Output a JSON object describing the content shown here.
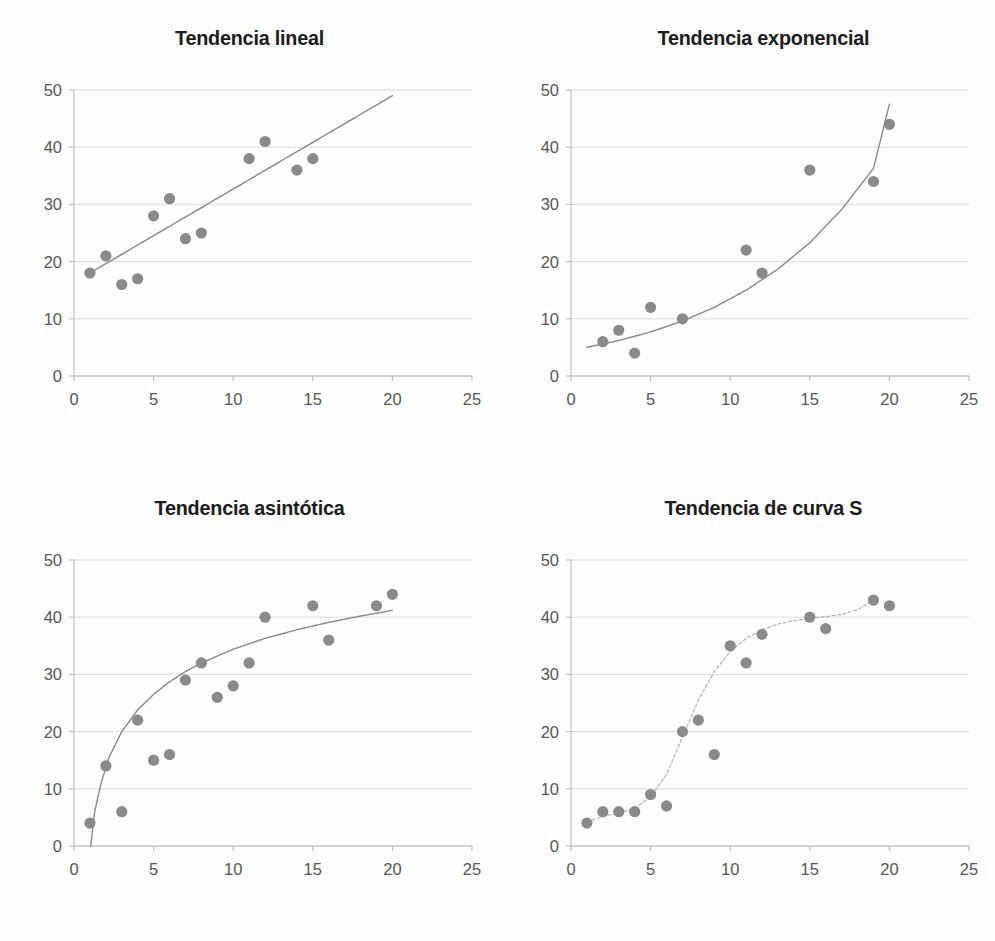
{
  "figure": {
    "background": "#fdfdfd",
    "dot_color": "#8a8a8a",
    "line_color": "#7d7d7d",
    "grid_color": "#d6d6de",
    "axis_color": "#b9b9c2",
    "tick_text_color": "#575757",
    "title_color": "#1b1b1b"
  },
  "panels": [
    {
      "id": "lineal",
      "title": "Tendencia lineal",
      "chart_data": {
        "type": "scatter",
        "title": "Tendencia lineal",
        "xlabel": "",
        "ylabel": "",
        "xlim": [
          0,
          25
        ],
        "ylim": [
          0,
          50
        ],
        "xticks": [
          "0",
          "5",
          "10",
          "15",
          "20",
          "25"
        ],
        "yticks": [
          "0",
          "10",
          "20",
          "30",
          "40",
          "50"
        ],
        "grid": true,
        "legend": "none",
        "points": [
          {
            "x": 1,
            "y": 18
          },
          {
            "x": 2,
            "y": 21
          },
          {
            "x": 3,
            "y": 16
          },
          {
            "x": 4,
            "y": 17
          },
          {
            "x": 5,
            "y": 28
          },
          {
            "x": 6,
            "y": 31
          },
          {
            "x": 7,
            "y": 24
          },
          {
            "x": 8,
            "y": 25
          },
          {
            "x": 11,
            "y": 38
          },
          {
            "x": 12,
            "y": 41
          },
          {
            "x": 14,
            "y": 36
          },
          {
            "x": 15,
            "y": 38
          }
        ],
        "trend": {
          "kind": "linear",
          "annotation": "recta de regresion",
          "points": [
            {
              "x": 1,
              "y": 18.0
            },
            {
              "x": 20,
              "y": 49.0
            }
          ]
        }
      }
    },
    {
      "id": "exponencial",
      "title": "Tendencia exponencial",
      "chart_data": {
        "type": "scatter",
        "title": "Tendencia exponencial",
        "xlabel": "",
        "ylabel": "",
        "xlim": [
          0,
          25
        ],
        "ylim": [
          0,
          50
        ],
        "xticks": [
          "0",
          "5",
          "10",
          "15",
          "20",
          "25"
        ],
        "yticks": [
          "0",
          "10",
          "20",
          "30",
          "40",
          "50"
        ],
        "grid": true,
        "legend": "none",
        "points": [
          {
            "x": 2,
            "y": 6
          },
          {
            "x": 3,
            "y": 8
          },
          {
            "x": 4,
            "y": 4
          },
          {
            "x": 5,
            "y": 12
          },
          {
            "x": 7,
            "y": 10
          },
          {
            "x": 11,
            "y": 22
          },
          {
            "x": 12,
            "y": 18
          },
          {
            "x": 15,
            "y": 36
          },
          {
            "x": 19,
            "y": 34
          },
          {
            "x": 20,
            "y": 44
          }
        ],
        "trend": {
          "kind": "exponential",
          "annotation": "curva exponencial",
          "points": [
            {
              "x": 1,
              "y": 5.0
            },
            {
              "x": 3,
              "y": 6.2
            },
            {
              "x": 5,
              "y": 7.7
            },
            {
              "x": 7,
              "y": 9.6
            },
            {
              "x": 9,
              "y": 12.0
            },
            {
              "x": 11,
              "y": 15.0
            },
            {
              "x": 13,
              "y": 18.7
            },
            {
              "x": 15,
              "y": 23.3
            },
            {
              "x": 17,
              "y": 29.1
            },
            {
              "x": 19,
              "y": 36.3
            },
            {
              "x": 20,
              "y": 47.5
            }
          ]
        }
      }
    },
    {
      "id": "asintotica",
      "title": "Tendencia asintótica",
      "chart_data": {
        "type": "scatter",
        "title": "Tendencia asintótica",
        "xlabel": "",
        "ylabel": "",
        "xlim": [
          0,
          25
        ],
        "ylim": [
          0,
          50
        ],
        "xticks": [
          "0",
          "5",
          "10",
          "15",
          "20",
          "25"
        ],
        "yticks": [
          "0",
          "10",
          "20",
          "30",
          "40",
          "50"
        ],
        "grid": true,
        "legend": "none",
        "points": [
          {
            "x": 1,
            "y": 4
          },
          {
            "x": 2,
            "y": 14
          },
          {
            "x": 3,
            "y": 6
          },
          {
            "x": 4,
            "y": 22
          },
          {
            "x": 5,
            "y": 15
          },
          {
            "x": 6,
            "y": 16
          },
          {
            "x": 7,
            "y": 29
          },
          {
            "x": 8,
            "y": 32
          },
          {
            "x": 9,
            "y": 26
          },
          {
            "x": 10,
            "y": 28
          },
          {
            "x": 11,
            "y": 32
          },
          {
            "x": 12,
            "y": 40
          },
          {
            "x": 15,
            "y": 42
          },
          {
            "x": 16,
            "y": 36
          },
          {
            "x": 19,
            "y": 42
          },
          {
            "x": 20,
            "y": 44
          }
        ],
        "trend": {
          "kind": "asymptotic",
          "annotation": "curva asintotica",
          "points": [
            {
              "x": 1.05,
              "y": 0.0
            },
            {
              "x": 1.3,
              "y": 6.0
            },
            {
              "x": 1.7,
              "y": 11.0
            },
            {
              "x": 2.2,
              "y": 15.5
            },
            {
              "x": 3.0,
              "y": 20.0
            },
            {
              "x": 4.0,
              "y": 23.8
            },
            {
              "x": 5.0,
              "y": 26.5
            },
            {
              "x": 6.0,
              "y": 28.7
            },
            {
              "x": 7.0,
              "y": 30.5
            },
            {
              "x": 8.0,
              "y": 32.0
            },
            {
              "x": 10.0,
              "y": 34.4
            },
            {
              "x": 12.0,
              "y": 36.3
            },
            {
              "x": 14.0,
              "y": 37.8
            },
            {
              "x": 16.0,
              "y": 39.1
            },
            {
              "x": 18.0,
              "y": 40.2
            },
            {
              "x": 20.0,
              "y": 41.2
            }
          ]
        }
      }
    },
    {
      "id": "curva-s",
      "title": "Tendencia de curva S",
      "chart_data": {
        "type": "scatter",
        "title": "Tendencia de curva S",
        "xlabel": "",
        "ylabel": "",
        "xlim": [
          0,
          25
        ],
        "ylim": [
          0,
          50
        ],
        "xticks": [
          "0",
          "5",
          "10",
          "15",
          "20",
          "25"
        ],
        "yticks": [
          "0",
          "10",
          "20",
          "30",
          "40",
          "50"
        ],
        "grid": true,
        "legend": "none",
        "points": [
          {
            "x": 1,
            "y": 4
          },
          {
            "x": 2,
            "y": 6
          },
          {
            "x": 3,
            "y": 6
          },
          {
            "x": 4,
            "y": 6
          },
          {
            "x": 5,
            "y": 9
          },
          {
            "x": 6,
            "y": 7
          },
          {
            "x": 7,
            "y": 20
          },
          {
            "x": 8,
            "y": 22
          },
          {
            "x": 9,
            "y": 16
          },
          {
            "x": 10,
            "y": 35
          },
          {
            "x": 11,
            "y": 32
          },
          {
            "x": 12,
            "y": 37
          },
          {
            "x": 15,
            "y": 40
          },
          {
            "x": 16,
            "y": 38
          },
          {
            "x": 19,
            "y": 43
          },
          {
            "x": 20,
            "y": 42
          }
        ],
        "trend": {
          "kind": "sigmoid",
          "annotation": "curva S",
          "points": [
            {
              "x": 1,
              "y": 4.2
            },
            {
              "x": 2,
              "y": 5.2
            },
            {
              "x": 3,
              "y": 5.8
            },
            {
              "x": 4,
              "y": 6.6
            },
            {
              "x": 5,
              "y": 8.6
            },
            {
              "x": 6,
              "y": 12.5
            },
            {
              "x": 7,
              "y": 19.0
            },
            {
              "x": 8,
              "y": 25.5
            },
            {
              "x": 9,
              "y": 30.5
            },
            {
              "x": 10,
              "y": 34.0
            },
            {
              "x": 11,
              "y": 36.3
            },
            {
              "x": 12,
              "y": 37.8
            },
            {
              "x": 13,
              "y": 38.8
            },
            {
              "x": 14,
              "y": 39.4
            },
            {
              "x": 15,
              "y": 39.8
            },
            {
              "x": 16,
              "y": 40.1
            },
            {
              "x": 17,
              "y": 40.5
            },
            {
              "x": 18,
              "y": 41.3
            },
            {
              "x": 19,
              "y": 43.0
            }
          ]
        }
      }
    }
  ]
}
